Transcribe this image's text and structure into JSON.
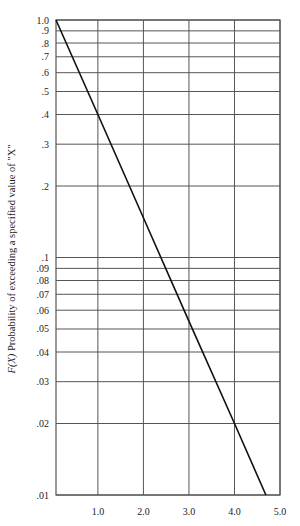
{
  "chart_data": {
    "type": "line",
    "title": "",
    "xlabel": "",
    "ylabel": "F(X) Probability of exceeding a specified value of \"X\"",
    "ylabel_italic_prefix": "F(X)",
    "ylabel_rest": " Probability of exceeding a specified value of \"X\"",
    "yscale": "log",
    "xlim": [
      0.08,
      5.0
    ],
    "ylim": [
      0.01,
      1.0
    ],
    "grid": true,
    "x_ticks": [
      1.0,
      2.0,
      3.0,
      4.0,
      5.0
    ],
    "x_tick_labels": [
      "1.0",
      "2.0",
      "3.0",
      "4.0",
      "5.0"
    ],
    "y_ticks": [
      1.0,
      0.9,
      0.8,
      0.7,
      0.6,
      0.5,
      0.4,
      0.3,
      0.2,
      0.1,
      0.09,
      0.08,
      0.07,
      0.06,
      0.05,
      0.04,
      0.03,
      0.02,
      0.01
    ],
    "y_tick_labels": [
      "1.0",
      ".9",
      ".8",
      ".7",
      ".6",
      ".5",
      ".4",
      ".3",
      ".2",
      ".1",
      ".09",
      ".08",
      ".07",
      ".06",
      ".05",
      ".04",
      ".03",
      ".02",
      ".01"
    ],
    "series": [
      {
        "name": "F(X)",
        "x": [
          0.08,
          1.0,
          2.0,
          3.0,
          4.0,
          4.69
        ],
        "y": [
          1.0,
          0.4,
          0.147,
          0.054,
          0.02,
          0.01
        ]
      }
    ],
    "legend": null
  },
  "colors": {
    "grid": "#555555",
    "line": "#111111",
    "text": "#222222"
  }
}
